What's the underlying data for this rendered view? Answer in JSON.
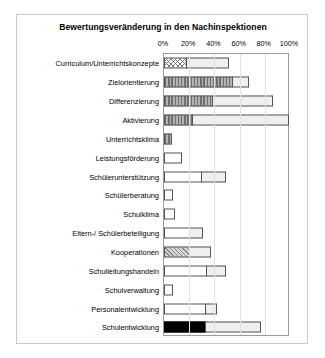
{
  "chart_data": {
    "type": "bar",
    "orientation": "horizontal",
    "stacked": true,
    "title": "Bewertungsveränderung in den Nachinspektionen",
    "xlabel": "",
    "ylabel": "",
    "xlim": [
      0,
      100
    ],
    "grid": true,
    "legend": "none",
    "tick_labels": [
      "0%",
      "20%",
      "40%",
      "60%",
      "80%",
      "100%"
    ],
    "tick_values": [
      0,
      20,
      40,
      60,
      80,
      100
    ],
    "categories": [
      "Curriculum/Unterrichtskonzepte",
      "Zielorientierung",
      "Differenzierung",
      "Aktivierung",
      "Unterrichtsklima",
      "Leistungsförderung",
      "Schülerunterstützung",
      "Schülerberatung",
      "Schulklima",
      "Eltern-/ Schülerbeteiligung",
      "Kooperationen",
      "Schulleitungshandeln",
      "Schulverwaltung",
      "Personalentwicklung",
      "Schulentwicklung"
    ],
    "series": [
      {
        "name": "Segment 1",
        "values": [
          18,
          55,
          39,
          23,
          6,
          14,
          30,
          7,
          9,
          21,
          21,
          34,
          7,
          33,
          33
        ]
      },
      {
        "name": "Segment 2",
        "values": [
          34,
          13,
          48,
          77,
          0,
          0,
          20,
          0,
          0,
          11,
          17,
          16,
          0,
          10,
          45
        ]
      }
    ],
    "bars": [
      {
        "label": "Curriculum/Unterrichtskonzepte",
        "segments": [
          {
            "value": 18,
            "pattern": "crosshatch"
          },
          {
            "value": 34,
            "pattern": "dotted"
          }
        ]
      },
      {
        "label": "Zielorientierung",
        "segments": [
          {
            "value": 55,
            "pattern": "vstripe"
          },
          {
            "value": 13,
            "pattern": "dotted"
          }
        ]
      },
      {
        "label": "Differenzierung",
        "segments": [
          {
            "value": 39,
            "pattern": "vstripe"
          },
          {
            "value": 48,
            "pattern": "dotted"
          }
        ]
      },
      {
        "label": "Aktivierung",
        "segments": [
          {
            "value": 23,
            "pattern": "vstripe"
          },
          {
            "value": 77,
            "pattern": "dotted"
          }
        ]
      },
      {
        "label": "Unterrichtsklima",
        "segments": [
          {
            "value": 6,
            "pattern": "vstripe"
          }
        ]
      },
      {
        "label": "Leistungsförderung",
        "segments": [
          {
            "value": 14,
            "pattern": "white"
          }
        ]
      },
      {
        "label": "Schülerunterstützung",
        "segments": [
          {
            "value": 30,
            "pattern": "white"
          },
          {
            "value": 20,
            "pattern": "dotted"
          }
        ]
      },
      {
        "label": "Schülerberatung",
        "segments": [
          {
            "value": 7,
            "pattern": "white"
          }
        ]
      },
      {
        "label": "Schulklima",
        "segments": [
          {
            "value": 9,
            "pattern": "white"
          }
        ]
      },
      {
        "label": "Eltern-/ Schülerbeteiligung",
        "segments": [
          {
            "value": 21,
            "pattern": "white"
          },
          {
            "value": 11,
            "pattern": "dotted"
          }
        ]
      },
      {
        "label": "Kooperationen",
        "segments": [
          {
            "value": 21,
            "pattern": "diag"
          },
          {
            "value": 17,
            "pattern": "dotted"
          }
        ]
      },
      {
        "label": "Schulleitungshandeln",
        "segments": [
          {
            "value": 34,
            "pattern": "white"
          },
          {
            "value": 16,
            "pattern": "dotted"
          }
        ]
      },
      {
        "label": "Schulverwaltung",
        "segments": [
          {
            "value": 7,
            "pattern": "white"
          }
        ]
      },
      {
        "label": "Personalentwicklung",
        "segments": [
          {
            "value": 33,
            "pattern": "white"
          },
          {
            "value": 10,
            "pattern": "dotted"
          }
        ]
      },
      {
        "label": "Schulentwicklung",
        "segments": [
          {
            "value": 33,
            "pattern": "black"
          },
          {
            "value": 45,
            "pattern": "dotted"
          }
        ]
      }
    ]
  }
}
